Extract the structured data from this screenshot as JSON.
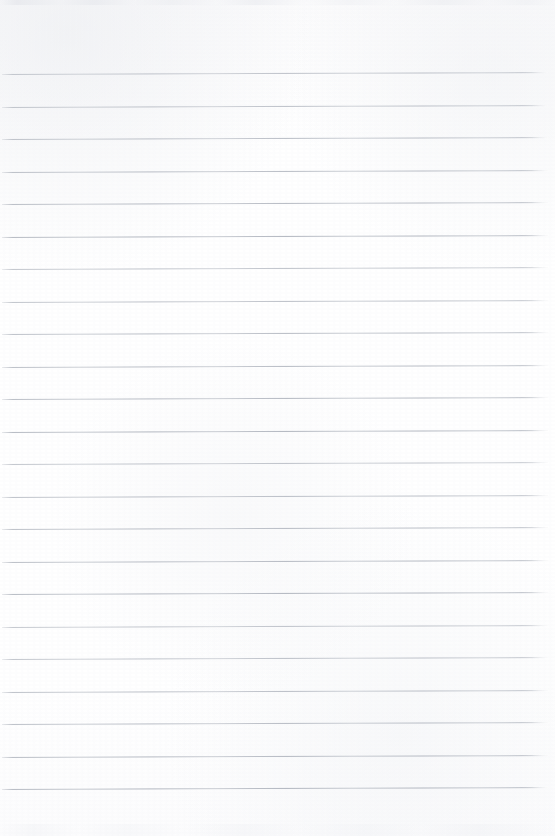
{
  "document": {
    "kind": "scanned-lined-paper",
    "title": "Blank Lined Notebook Page",
    "page_width": 555,
    "page_height": 836,
    "background_color": "#fdfdfd",
    "has_text_content": false,
    "handwriting_present": false,
    "printed_text_present": false,
    "margin_line_present": false,
    "header_text": "",
    "footer_text": "",
    "page_number": ""
  },
  "ruling": {
    "line_count": 23,
    "line_color": "#b4b9c2",
    "line_thickness_px": 1,
    "line_spacing_px": 32.5,
    "first_line_y": 74,
    "last_line_y": 810,
    "line_start_x": 2,
    "line_end_x": 548,
    "slope_deg": -0.21,
    "top_margin_px": 74,
    "bottom_margin_px": 26,
    "left_margin_px": 2,
    "right_margin_px": 7,
    "line_y_positions": [
      74,
      106.5,
      139,
      171.5,
      204,
      236.5,
      269,
      301.5,
      334,
      366.5,
      399,
      431.5,
      464,
      496.5,
      529,
      561.5,
      594,
      626.5,
      659,
      691.5,
      724,
      756.5,
      789
    ]
  },
  "artifacts": {
    "top_edge_smudge": true,
    "bottom_edge_smudge": true,
    "paper_grain": true,
    "scan_noise_opacity": 0.5
  }
}
